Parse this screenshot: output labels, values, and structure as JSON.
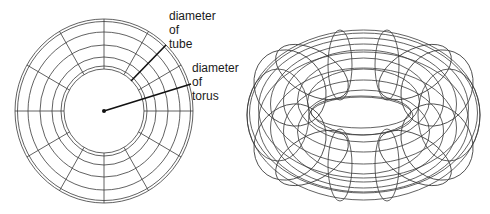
{
  "figure": {
    "left_view": {
      "name": "top view of torus",
      "labels": {
        "tube": [
          "diameter",
          "of",
          "tube"
        ],
        "torus": [
          "diameter",
          "of",
          "torus"
        ]
      }
    },
    "right_view": {
      "name": "isometric wireframe torus"
    },
    "colors": {
      "line": "#3a3a3a",
      "leader": "#111111",
      "background": "#ffffff",
      "text": "#1a1a1a"
    }
  }
}
